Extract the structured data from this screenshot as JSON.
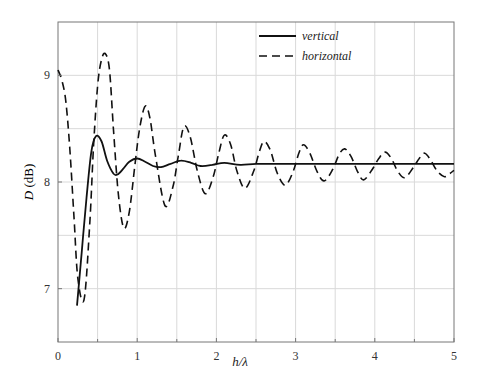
{
  "chart_data": {
    "type": "line",
    "title": "",
    "xlabel": "h/λ",
    "ylabel": "D (dB)",
    "xlim": [
      0,
      5
    ],
    "ylim": [
      6.5,
      9.5
    ],
    "xticks": [
      0,
      1,
      2,
      3,
      4,
      5
    ],
    "xtick_labels": [
      "0",
      "1",
      "2",
      "3",
      "4",
      "5"
    ],
    "yticks": [
      7,
      8,
      9
    ],
    "ytick_labels": [
      "7",
      "8",
      "9"
    ],
    "grid": true,
    "minor_grid_x": [
      0.5,
      1.5,
      2.5,
      3.5,
      4.5
    ],
    "minor_grid_y": [
      7.5,
      8.5
    ],
    "legend_position": "upper right",
    "series": [
      {
        "name": "vertical",
        "style": "solid",
        "color": "#111111",
        "x": [
          0.24,
          0.3,
          0.36,
          0.42,
          0.48,
          0.55,
          0.62,
          0.7,
          0.75,
          0.82,
          0.9,
          1.0,
          1.1,
          1.2,
          1.3,
          1.42,
          1.55,
          1.68,
          1.8,
          1.95,
          2.1,
          2.3,
          2.5,
          2.75,
          3.0,
          3.5,
          4.0,
          4.5,
          5.0
        ],
        "y": [
          6.84,
          7.35,
          7.85,
          8.28,
          8.43,
          8.38,
          8.2,
          8.08,
          8.07,
          8.12,
          8.19,
          8.22,
          8.19,
          8.15,
          8.14,
          8.17,
          8.2,
          8.18,
          8.15,
          8.16,
          8.18,
          8.16,
          8.17,
          8.17,
          8.17,
          8.17,
          8.17,
          8.17,
          8.17
        ]
      },
      {
        "name": "horizontal",
        "style": "dashed",
        "color": "#111111",
        "x": [
          0.0,
          0.05,
          0.1,
          0.15,
          0.2,
          0.25,
          0.33,
          0.4,
          0.45,
          0.5,
          0.55,
          0.6,
          0.65,
          0.7,
          0.76,
          0.83,
          0.9,
          0.97,
          1.03,
          1.1,
          1.16,
          1.23,
          1.35,
          1.45,
          1.52,
          1.59,
          1.67,
          1.76,
          1.86,
          1.96,
          2.03,
          2.1,
          2.18,
          2.26,
          2.36,
          2.47,
          2.54,
          2.6,
          2.68,
          2.77,
          2.87,
          2.97,
          3.04,
          3.1,
          3.18,
          3.27,
          3.36,
          3.47,
          3.55,
          3.62,
          3.7,
          3.78,
          3.86,
          3.97,
          4.05,
          4.13,
          4.21,
          4.29,
          4.38,
          4.49,
          4.56,
          4.63,
          4.71,
          4.79,
          4.88,
          4.95,
          5.0
        ],
        "y": [
          9.05,
          8.95,
          8.75,
          8.3,
          7.7,
          7.1,
          6.9,
          7.6,
          8.35,
          8.9,
          9.15,
          9.2,
          9.05,
          8.5,
          7.9,
          7.57,
          7.72,
          8.15,
          8.5,
          8.71,
          8.6,
          8.25,
          7.78,
          7.95,
          8.25,
          8.52,
          8.42,
          8.1,
          7.89,
          8.05,
          8.27,
          8.44,
          8.35,
          8.1,
          7.94,
          8.1,
          8.28,
          8.38,
          8.3,
          8.08,
          7.97,
          8.1,
          8.27,
          8.35,
          8.27,
          8.1,
          8.01,
          8.12,
          8.26,
          8.31,
          8.24,
          8.1,
          8.02,
          8.12,
          8.22,
          8.28,
          8.22,
          8.1,
          8.04,
          8.14,
          8.22,
          8.27,
          8.2,
          8.1,
          8.05,
          8.08,
          8.11
        ]
      }
    ]
  },
  "legend": {
    "items": [
      {
        "label": "vertical",
        "style": "solid"
      },
      {
        "label": "horizontal",
        "style": "dashed"
      }
    ]
  },
  "axes": {
    "xlabel": "h/λ",
    "ylabel_italic": "D",
    "ylabel_unit": " (dB)"
  },
  "colors": {
    "axis": "#555555",
    "grid": "#d9d9d9",
    "line": "#111111"
  }
}
